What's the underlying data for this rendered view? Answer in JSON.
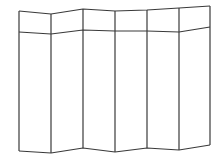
{
  "figure": {
    "panel_count": 6,
    "stroke_color": "#3a3a3a",
    "background": "#ffffff",
    "fold_x": [
      19,
      51,
      83,
      115,
      147,
      179,
      210
    ],
    "top_y": [
      11,
      14,
      9,
      11,
      10,
      8,
      6
    ],
    "band_y": [
      32,
      34,
      30,
      31,
      31,
      32,
      27
    ],
    "bottom_y": [
      151,
      153,
      148,
      152,
      148,
      150,
      145
    ]
  }
}
